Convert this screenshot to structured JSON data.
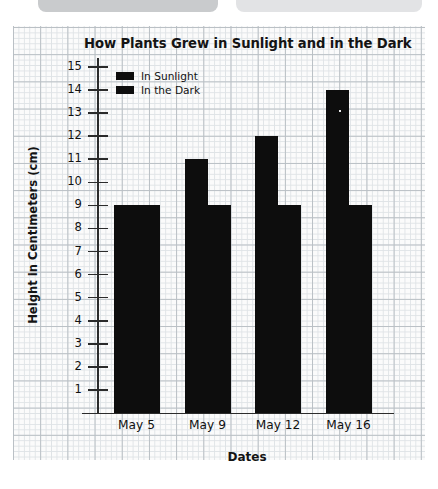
{
  "top_chrome": {
    "pill_left_label": "",
    "pill_right_label": ""
  },
  "chart_data": {
    "type": "bar",
    "title": "How Plants Grew in Sunlight and in the Dark",
    "xlabel": "Dates",
    "ylabel": "Height in Centimeters (cm)",
    "categories": [
      "May 5",
      "May 9",
      "May 12",
      "May 16"
    ],
    "series": [
      {
        "name": "In Sunlight",
        "color": "#0d0d0d",
        "values": [
          9,
          11,
          12,
          14
        ]
      },
      {
        "name": "In the Dark",
        "color": "#0d0d0d",
        "values": [
          9,
          9,
          9,
          9
        ]
      }
    ],
    "ylim": [
      0,
      15
    ],
    "yticks": [
      15,
      14,
      13,
      12,
      11,
      10,
      9,
      8,
      7,
      6,
      5,
      4,
      3,
      2,
      1
    ],
    "grid": true,
    "grid_style": "graph-paper",
    "legend_position": "top-left"
  }
}
